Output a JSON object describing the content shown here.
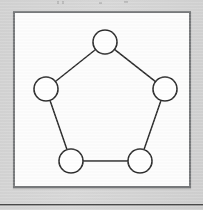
{
  "page": {
    "background_color": "#d4d4d4",
    "width": 203,
    "height": 210
  },
  "figure": {
    "box": {
      "border_color": "#77797b",
      "fill_color": "#fdfdfd",
      "x": 13,
      "y": 11,
      "width": 178,
      "height": 177
    },
    "caption": "",
    "graph": {
      "type": "cycle-graph",
      "name": "C5",
      "node_count": 5,
      "edge_count": 5,
      "node_radius": 12,
      "node_fill": "#ffffff",
      "node_stroke": "#2b2b2b",
      "edge_stroke": "#2b2b2b",
      "nodes": [
        {
          "id": "n1",
          "label": "",
          "cx": 90,
          "cy": 29
        },
        {
          "id": "n2",
          "label": "",
          "cx": 31,
          "cy": 76
        },
        {
          "id": "n3",
          "label": "",
          "cx": 150,
          "cy": 76
        },
        {
          "id": "n4",
          "label": "",
          "cx": 56,
          "cy": 148
        },
        {
          "id": "n5",
          "label": "",
          "cx": 125,
          "cy": 148
        }
      ],
      "edges": [
        {
          "from": "n1",
          "to": "n2"
        },
        {
          "from": "n1",
          "to": "n3"
        },
        {
          "from": "n2",
          "to": "n4"
        },
        {
          "from": "n3",
          "to": "n5"
        },
        {
          "from": "n4",
          "to": "n5"
        }
      ]
    }
  },
  "bottom_rule": {
    "color": "#4a4a4a",
    "y": 204
  }
}
